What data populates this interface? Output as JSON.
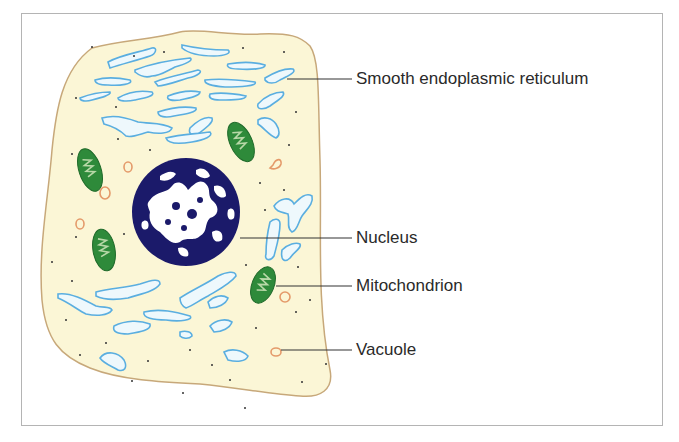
{
  "diagram": {
    "labels": [
      {
        "id": "ser",
        "text": "Smooth endoplasmic reticulum"
      },
      {
        "id": "nucleus",
        "text": "Nucleus"
      },
      {
        "id": "mitochondrion",
        "text": "Mitochondrion"
      },
      {
        "id": "vacuole",
        "text": "Vacuole"
      }
    ],
    "colors": {
      "cytoplasm": "#fbf6d6",
      "membrane": "#c7a87a",
      "er_stroke": "#5aaee0",
      "er_fill": "#eef8fc",
      "nucleus": "#1b1a6a",
      "mitochondrion": "#2e8a3a",
      "vacuole": "#e49a6a",
      "leader_line": "#333333",
      "frame": "#b4b4b4"
    }
  }
}
